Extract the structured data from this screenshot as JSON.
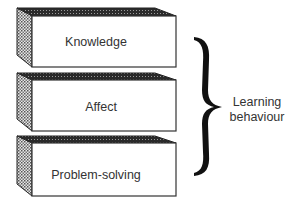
{
  "diagram": {
    "boxes": [
      {
        "label": "Knowledge",
        "top": 8,
        "front_top": 16,
        "front_bottom": 67
      },
      {
        "label": "Affect",
        "top": 73,
        "front_top": 80,
        "front_bottom": 131
      },
      {
        "label": "Problem-solving",
        "top": 136,
        "front_top": 143,
        "front_bottom": 196
      }
    ],
    "bracket": {
      "label_line1": "Learning",
      "label_line2": "behaviour"
    },
    "colors": {
      "edge": "#222222",
      "top_face": "#3a3a3a",
      "side_face": "#8a8a8a",
      "front_face": "#ffffff",
      "text": "#333333"
    }
  }
}
